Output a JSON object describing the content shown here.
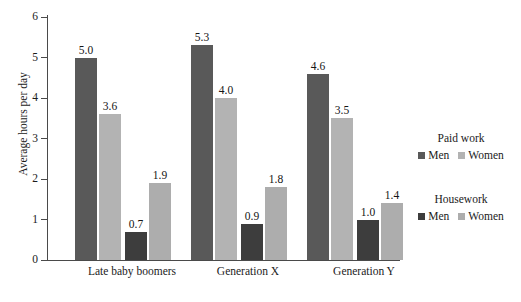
{
  "chart_data": {
    "type": "bar",
    "title": "",
    "xlabel": "",
    "ylabel": "Average hours per day",
    "ylim": [
      0,
      6
    ],
    "ytick_labels": [
      "6",
      "5",
      "4",
      "3",
      "2",
      "1",
      "0"
    ],
    "ytick_values": [
      6,
      5,
      4,
      3,
      2,
      1,
      0
    ],
    "grid": false,
    "legend_position": "right",
    "categories": [
      "Late baby boomers",
      "Generation X",
      "Generation Y"
    ],
    "series": [
      {
        "name": "Men",
        "group": "Paid work",
        "color": "#595959",
        "values": [
          5.0,
          5.3,
          4.6
        ],
        "labels": [
          "5.0",
          "5.3",
          "4.6"
        ]
      },
      {
        "name": "Women",
        "group": "Paid work",
        "color": "#b3b3b3",
        "values": [
          3.6,
          4.0,
          3.5
        ],
        "labels": [
          "3.6",
          "4.0",
          "3.5"
        ]
      },
      {
        "name": "Men",
        "group": "Housework",
        "color": "#3d3d3d",
        "values": [
          0.7,
          0.9,
          1.0
        ],
        "labels": [
          "0.7",
          "0.9",
          "1.0"
        ]
      },
      {
        "name": "Women",
        "group": "Housework",
        "color": "#adadad",
        "values": [
          1.9,
          1.8,
          1.4
        ],
        "labels": [
          "1.9",
          "1.8",
          "1.4"
        ]
      }
    ]
  },
  "axis": {
    "y_title": "Average hours per day",
    "ticks": [
      "6",
      "5",
      "4",
      "3",
      "2",
      "1",
      "0"
    ]
  },
  "categories": {
    "c0": "Late baby boomers",
    "c1": "Generation X",
    "c2": "Generation Y"
  },
  "bars": {
    "g0": {
      "b0": "5.0",
      "b1": "3.6",
      "b2": "0.7",
      "b3": "1.9"
    },
    "g1": {
      "b0": "5.3",
      "b1": "4.0",
      "b2": "0.9",
      "b3": "1.8"
    },
    "g2": {
      "b0": "4.6",
      "b1": "3.5",
      "b2": "1.0",
      "b3": "1.4"
    }
  },
  "legend": {
    "paid": {
      "title": "Paid work",
      "men": "Men",
      "women": "Women",
      "men_color": "#595959",
      "women_color": "#b3b3b3"
    },
    "housework": {
      "title": "Housework",
      "men": "Men",
      "women": "Women",
      "men_color": "#3d3d3d",
      "women_color": "#adadad"
    }
  }
}
